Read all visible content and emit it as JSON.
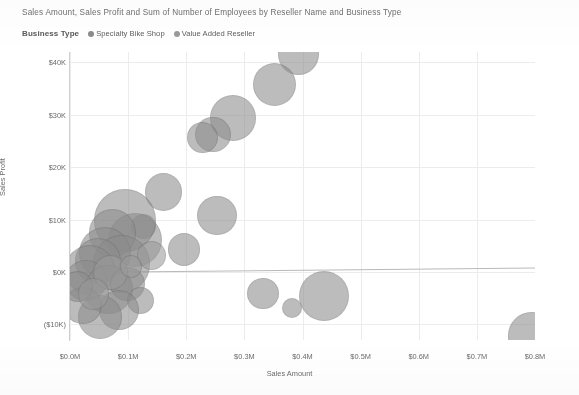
{
  "header": {
    "title": "Sales Amount, Sales Profit and Sum of Number of Employees by Reseller Name and Business Type"
  },
  "legend": {
    "title": "Business Type",
    "items": [
      {
        "label": "Specialty Bike Shop",
        "color": "#8c8c8c"
      },
      {
        "label": "Value Added Reseller",
        "color": "#9a9a9a"
      }
    ]
  },
  "axes": {
    "y_label": "Sales Profit",
    "x_label": "Sales Amount",
    "y_ticks": [
      "$40K",
      "$30K",
      "$20K",
      "$10K",
      "$0K",
      "($10K)"
    ],
    "x_ticks": [
      "$0.0M",
      "$0.1M",
      "$0.2M",
      "$0.3M",
      "$0.4M",
      "$0.5M",
      "$0.6M",
      "$0.7M",
      "$0.8M"
    ]
  },
  "chart_data": {
    "type": "scatter",
    "title": "Sales Amount, Sales Profit and Sum of Number of Employees by Reseller Name and Business Type",
    "xlabel": "Sales Amount",
    "ylabel": "Sales Profit",
    "xlim": [
      0,
      800000
    ],
    "ylim": [
      -13000,
      42000
    ],
    "xtick_values": [
      0,
      100000,
      200000,
      300000,
      400000,
      500000,
      600000,
      700000,
      800000
    ],
    "ytick_values": [
      40000,
      30000,
      20000,
      10000,
      0,
      -10000
    ],
    "grid": true,
    "legend_position": "top-left",
    "size_encodes": "Sum of Number of Employees",
    "series": [
      {
        "name": "Specialty Bike Shop",
        "color": "#8c8c8c",
        "points": [
          {
            "x": 393000,
            "y": 41500,
            "size": 40
          },
          {
            "x": 352000,
            "y": 35800,
            "size": 42
          },
          {
            "x": 281000,
            "y": 29400,
            "size": 44
          },
          {
            "x": 246000,
            "y": 26300,
            "size": 34
          },
          {
            "x": 228000,
            "y": 25600,
            "size": 30
          },
          {
            "x": 161000,
            "y": 15300,
            "size": 36
          },
          {
            "x": 253000,
            "y": 10800,
            "size": 38
          },
          {
            "x": 196000,
            "y": 4300,
            "size": 31
          },
          {
            "x": 126000,
            "y": 8700,
            "size": 24
          },
          {
            "x": 112000,
            "y": 6100,
            "size": 52
          },
          {
            "x": 95000,
            "y": 9800,
            "size": 60
          },
          {
            "x": 73000,
            "y": 7400,
            "size": 46
          },
          {
            "x": 61000,
            "y": 3600,
            "size": 50
          },
          {
            "x": 88000,
            "y": 1500,
            "size": 55
          },
          {
            "x": 48000,
            "y": 2100,
            "size": 44
          },
          {
            "x": 35000,
            "y": 400,
            "size": 48
          },
          {
            "x": 27000,
            "y": -1600,
            "size": 40
          },
          {
            "x": 66000,
            "y": -3400,
            "size": 47
          },
          {
            "x": 99000,
            "y": -2300,
            "size": 33
          },
          {
            "x": 122000,
            "y": -5400,
            "size": 26
          },
          {
            "x": 84000,
            "y": -7300,
            "size": 38
          },
          {
            "x": 52000,
            "y": -8600,
            "size": 42
          },
          {
            "x": 22000,
            "y": -6400,
            "size": 36
          },
          {
            "x": 13000,
            "y": -2800,
            "size": 30
          },
          {
            "x": 332000,
            "y": -4100,
            "size": 30
          },
          {
            "x": 382000,
            "y": -6900,
            "size": 20
          },
          {
            "x": 437000,
            "y": -4600,
            "size": 48
          },
          {
            "x": 794000,
            "y": -12200,
            "size": 46
          }
        ]
      },
      {
        "name": "Value Added Reseller",
        "color": "#9a9a9a",
        "points": [
          {
            "x": 140000,
            "y": 3100,
            "size": 28
          },
          {
            "x": 70000,
            "y": -50,
            "size": 34
          },
          {
            "x": 41000,
            "y": -4200,
            "size": 30
          },
          {
            "x": 105000,
            "y": 1100,
            "size": 22
          }
        ]
      }
    ]
  }
}
